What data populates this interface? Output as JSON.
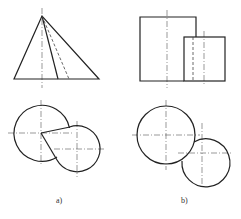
{
  "figure": {
    "panels": [
      {
        "id": "a",
        "label": "a)",
        "front_view": "cone (triangle) with solid and hidden generator lines",
        "top_view": "two intersecting circles with tangent lines"
      },
      {
        "id": "b",
        "label": "b)",
        "front_view": "two overlapping rectangles (cylinders) with hidden line",
        "top_view": "two intersecting circles"
      }
    ]
  },
  "colors": {
    "line": "#222222",
    "centerline": "#555555",
    "background": "#ffffff"
  }
}
